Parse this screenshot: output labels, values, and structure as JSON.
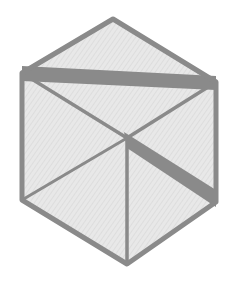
{
  "figure": {
    "type": "cube-outline-diagram",
    "colors": {
      "background": "#ffffff",
      "face_fill": "#e6e6e6",
      "edge": "#8a8a8a",
      "thick_band": "#8a8a8a"
    },
    "vertices": {
      "top": [
        113,
        19
      ],
      "upper_left": [
        22,
        73
      ],
      "upper_right": [
        216,
        82
      ],
      "center": [
        127,
        138
      ],
      "lower_left": [
        22,
        200
      ],
      "lower_right": [
        216,
        202
      ],
      "bottom": [
        127,
        264
      ]
    },
    "outer_stroke_width": 5,
    "inner_stroke_width": 3,
    "thick_band_width": 13
  }
}
